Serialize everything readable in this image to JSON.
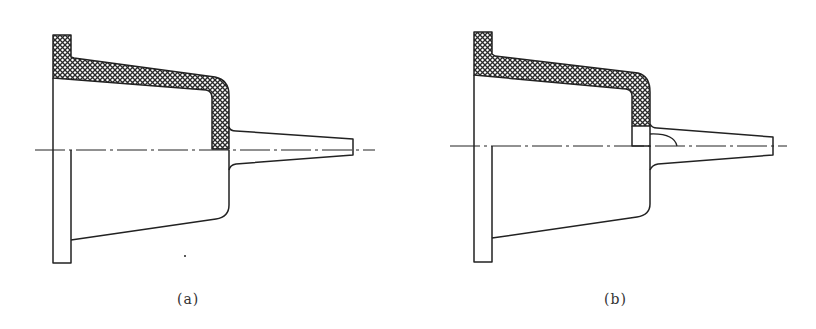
{
  "figure": {
    "panels": [
      {
        "id": "a",
        "caption": "(a)",
        "description": "Cross-section of flanged conical housing with tapered nozzle; upper half hatched wall section"
      },
      {
        "id": "b",
        "caption": "(b)",
        "description": "Same housing with additional insert block and fillet at nozzle root on the centerline"
      }
    ]
  },
  "colors": {
    "line": "#222222",
    "hatch": "#2a2a2a",
    "background": "#ffffff"
  }
}
